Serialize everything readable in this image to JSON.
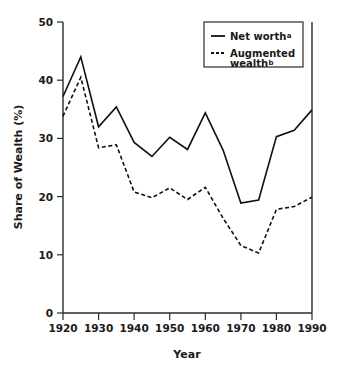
{
  "chart_data": {
    "type": "line",
    "title": "",
    "xlabel": "Year",
    "ylabel": "Share of Wealth (%)",
    "xlim": [
      1920,
      1990
    ],
    "ylim": [
      0,
      50
    ],
    "xticks": [
      1920,
      1930,
      1940,
      1950,
      1960,
      1970,
      1980,
      1990
    ],
    "yticks": [
      0,
      10,
      20,
      30,
      40,
      50
    ],
    "grid": false,
    "legend_position": "top-right",
    "x": [
      1920,
      1925,
      1930,
      1935,
      1940,
      1945,
      1950,
      1955,
      1960,
      1965,
      1970,
      1975,
      1980,
      1985,
      1990
    ],
    "series": [
      {
        "name": "Net worth",
        "note_marker": "a",
        "style": "solid",
        "color": "#101010",
        "values": [
          37.2,
          44.0,
          32.0,
          35.4,
          29.3,
          26.9,
          30.2,
          28.1,
          34.4,
          28.0,
          18.9,
          19.4,
          30.3,
          31.4,
          34.9
        ]
      },
      {
        "name": "Augmented wealth",
        "note_marker": "b",
        "style": "dashed",
        "color": "#101010",
        "values": [
          33.8,
          40.5,
          28.4,
          28.9,
          20.8,
          19.8,
          21.5,
          19.5,
          21.6,
          16.3,
          11.6,
          10.3,
          17.8,
          18.3,
          19.9
        ]
      }
    ]
  },
  "axis": {
    "y_title": "Share of Wealth (%)",
    "x_title": "Year",
    "y_tick_labels": [
      "0",
      "10",
      "20",
      "30",
      "40",
      "50"
    ],
    "x_tick_labels": [
      "1920",
      "1930",
      "1940",
      "1950",
      "1960",
      "1970",
      "1980",
      "1990"
    ]
  },
  "legend": {
    "entries": [
      {
        "label": "Net worth",
        "superscript": "a",
        "style": "solid"
      },
      {
        "label": "Augmented",
        "label_line2": "wealth",
        "superscript": "b",
        "style": "dashed"
      }
    ]
  },
  "colors": {
    "ink": "#101010",
    "axis": "#2b2b2b",
    "background": "#ffffff"
  }
}
